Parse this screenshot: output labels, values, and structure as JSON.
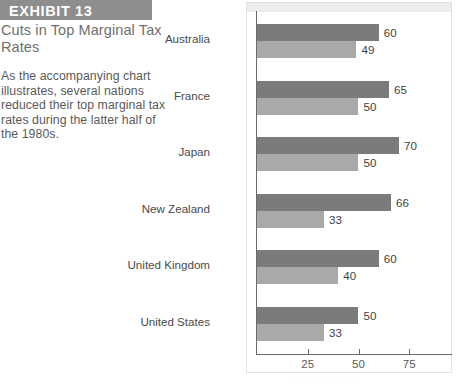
{
  "exhibit": {
    "banner_label": "EXHIBIT 13",
    "title": "Cuts in Top Marginal Tax Rates",
    "body": "As the accompanying chart illustrates, several nations reduced their top marginal tax rates during the latter half of the 1980s."
  },
  "colors": {
    "banner_bg": "#8e8e8e",
    "banner_text": "#ffffff",
    "title_text": "#6f6f6f",
    "body_text": "#5a5a5a",
    "bar_before": "#7b7b7b",
    "bar_after": "#a9a9a9",
    "axis": "#6a6a6a",
    "panel_band": "#ededed"
  },
  "chart_data": {
    "type": "bar",
    "orientation": "horizontal",
    "title": "",
    "xlabel": "",
    "ylabel": "",
    "xlim": [
      0,
      88
    ],
    "xticks": [
      25,
      50,
      75
    ],
    "xtick_labels": [
      "25",
      "50",
      "75"
    ],
    "grid": false,
    "legend_position": "bottom",
    "categories": [
      "Australia",
      "France",
      "Japan",
      "New Zealand",
      "United Kingdom",
      "United States"
    ],
    "series": [
      {
        "name": "before",
        "values": [
          60,
          65,
          70,
          66,
          60,
          50
        ]
      },
      {
        "name": "after",
        "values": [
          49,
          50,
          50,
          33,
          40,
          33
        ]
      }
    ]
  },
  "legend": {
    "faint_strip": "······   ······"
  }
}
